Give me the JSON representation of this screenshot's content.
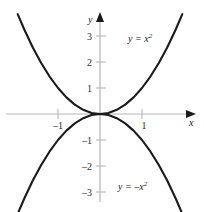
{
  "figure": {
    "background_color": "#ffffff",
    "axis_color": "#b5b5b5",
    "curve_color": "#1a1a1a",
    "tick_color": "#b5b5b5",
    "text_color": "#1a1a1a"
  },
  "axes": {
    "x_axis_label": "x",
    "y_axis_label": "y",
    "origin_px": {
      "x": 100,
      "y": 114
    },
    "x_unit_px": 42,
    "y_unit_px": 26
  },
  "chart_data": {
    "type": "line",
    "title": "",
    "xlabel": "x",
    "ylabel": "y",
    "xlim": [
      -2.35,
      2.35
    ],
    "ylim": [
      -3.85,
      3.85
    ],
    "grid": false,
    "legend": "inline-annotations",
    "xticks": [
      -1,
      1
    ],
    "xtick_labels": [
      "–1",
      "1"
    ],
    "yticks": [
      -3,
      -2,
      -1,
      1,
      2,
      3
    ],
    "ytick_labels": [
      "–3",
      "–2",
      "–1",
      "1",
      "2",
      "3"
    ],
    "series": [
      {
        "name": "y = x²",
        "equation": "y = x^2",
        "label_text": "y = x",
        "label_exponent": "2",
        "label_position": {
          "x": 128,
          "y": 33
        },
        "x": [
          -1.96,
          -1.8,
          -1.6,
          -1.4,
          -1.2,
          -1.0,
          -0.8,
          -0.6,
          -0.4,
          -0.2,
          0,
          0.2,
          0.4,
          0.6,
          0.8,
          1.0,
          1.2,
          1.4,
          1.6,
          1.8,
          1.96
        ],
        "y": [
          3.84,
          3.24,
          2.56,
          1.96,
          1.44,
          1.0,
          0.64,
          0.36,
          0.16,
          0.04,
          0,
          0.04,
          0.16,
          0.36,
          0.64,
          1.0,
          1.44,
          1.96,
          2.56,
          3.24,
          3.84
        ]
      },
      {
        "name": "y = −x²",
        "equation": "y = -x^2",
        "label_text": "y = –x",
        "label_exponent": "2",
        "label_position": {
          "x": 118,
          "y": 181
        },
        "x": [
          -1.96,
          -1.8,
          -1.6,
          -1.4,
          -1.2,
          -1.0,
          -0.8,
          -0.6,
          -0.4,
          -0.2,
          0,
          0.2,
          0.4,
          0.6,
          0.8,
          1.0,
          1.2,
          1.4,
          1.6,
          1.8,
          1.96
        ],
        "y": [
          -3.84,
          -3.24,
          -2.56,
          -1.96,
          -1.44,
          -1.0,
          -0.64,
          -0.36,
          -0.16,
          -0.04,
          0,
          -0.04,
          -0.16,
          -0.36,
          -0.64,
          -1.0,
          -1.44,
          -1.96,
          -2.56,
          -3.24,
          -3.84
        ]
      }
    ]
  }
}
